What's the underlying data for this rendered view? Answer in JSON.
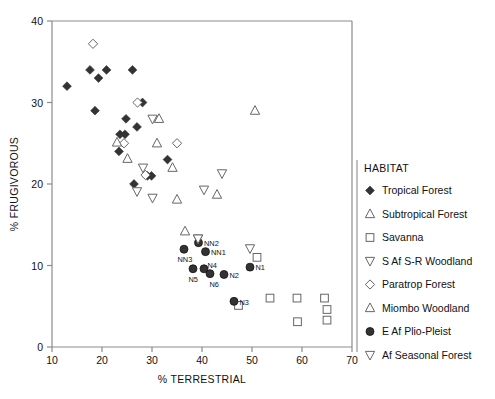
{
  "chart_data": {
    "type": "scatter",
    "title": "",
    "xlabel": "% TERRESTRIAL",
    "ylabel": "% FRUGIVOROUS",
    "xlim": [
      10,
      70
    ],
    "ylim": [
      0,
      40
    ],
    "xticks": [
      10,
      20,
      30,
      40,
      50,
      60,
      70
    ],
    "yticks": [
      0,
      10,
      20,
      30,
      40
    ],
    "grid": false,
    "legend_position": "right",
    "legend_title": "HABITAT",
    "series": [
      {
        "name": "Tropical Forest",
        "marker": "filled-diamond",
        "color": "#333333",
        "points": [
          {
            "x": 13.0,
            "y": 32.0
          },
          {
            "x": 17.6,
            "y": 34.0
          },
          {
            "x": 19.3,
            "y": 33.0
          },
          {
            "x": 20.9,
            "y": 34.0
          },
          {
            "x": 18.6,
            "y": 29.0
          },
          {
            "x": 26.1,
            "y": 34.0
          },
          {
            "x": 28.1,
            "y": 30.0
          },
          {
            "x": 24.8,
            "y": 28.0
          },
          {
            "x": 27.0,
            "y": 27.0
          },
          {
            "x": 23.6,
            "y": 26.1
          },
          {
            "x": 24.6,
            "y": 26.1
          },
          {
            "x": 23.4,
            "y": 24.0
          },
          {
            "x": 33.1,
            "y": 23.0
          },
          {
            "x": 26.4,
            "y": 20.0
          },
          {
            "x": 29.1,
            "y": 21.0
          },
          {
            "x": 29.9,
            "y": 21.0
          }
        ]
      },
      {
        "name": "Subtropical Forest",
        "marker": "open-triangle-up",
        "color": "#6b6b6b",
        "points": [
          {
            "x": 31.4,
            "y": 28.0
          },
          {
            "x": 31.0,
            "y": 25.0
          },
          {
            "x": 34.1,
            "y": 22.0
          },
          {
            "x": 50.6,
            "y": 29.0
          },
          {
            "x": 43.0,
            "y": 18.7
          },
          {
            "x": 35.0,
            "y": 18.1
          }
        ]
      },
      {
        "name": "Savanna",
        "marker": "open-square",
        "color": "#6b6b6b",
        "points": [
          {
            "x": 51.0,
            "y": 11.0
          },
          {
            "x": 47.3,
            "y": 5.1
          },
          {
            "x": 53.6,
            "y": 6.0
          },
          {
            "x": 59.0,
            "y": 6.0
          },
          {
            "x": 59.1,
            "y": 3.1
          },
          {
            "x": 64.5,
            "y": 6.0
          },
          {
            "x": 65.0,
            "y": 4.6
          },
          {
            "x": 65.0,
            "y": 3.3
          }
        ]
      },
      {
        "name": "S Af S-R Woodland",
        "marker": "open-triangle-down",
        "color": "#6b6b6b",
        "points": [
          {
            "x": 30.1,
            "y": 28.0
          },
          {
            "x": 28.2,
            "y": 22.0
          },
          {
            "x": 27.0,
            "y": 19.1
          },
          {
            "x": 30.1,
            "y": 18.3
          },
          {
            "x": 40.4,
            "y": 19.3
          },
          {
            "x": 44.0,
            "y": 21.3
          },
          {
            "x": 39.2,
            "y": 13.3
          },
          {
            "x": 49.6,
            "y": 12.1
          }
        ]
      },
      {
        "name": "Paratrop Forest",
        "marker": "open-diamond",
        "color": "#6b6b6b",
        "points": [
          {
            "x": 18.2,
            "y": 37.2
          },
          {
            "x": 27.1,
            "y": 30.0
          },
          {
            "x": 24.4,
            "y": 25.0
          },
          {
            "x": 35.0,
            "y": 25.0
          },
          {
            "x": 28.7,
            "y": 21.1
          }
        ]
      },
      {
        "name": "Miombo Woodland",
        "marker": "open-triangle-up",
        "color": "#6b6b6b",
        "points": [
          {
            "x": 23.0,
            "y": 25.1
          },
          {
            "x": 25.1,
            "y": 23.1
          },
          {
            "x": 36.6,
            "y": 14.2
          }
        ]
      },
      {
        "name": "E Af Plio-Pleist",
        "marker": "filled-circle",
        "color": "#333333",
        "points": [
          {
            "x": 36.4,
            "y": 12.0,
            "label": "NN3"
          },
          {
            "x": 39.3,
            "y": 12.8,
            "label": "NN2"
          },
          {
            "x": 40.7,
            "y": 11.7,
            "label": "NN1"
          },
          {
            "x": 38.2,
            "y": 9.6,
            "label": "N5"
          },
          {
            "x": 40.4,
            "y": 9.6,
            "label": "N4"
          },
          {
            "x": 41.6,
            "y": 9.0,
            "label": "N6"
          },
          {
            "x": 44.4,
            "y": 8.9,
            "label": "N2"
          },
          {
            "x": 49.6,
            "y": 9.8,
            "label": "N1"
          },
          {
            "x": 46.4,
            "y": 5.6,
            "label": "N3"
          }
        ]
      },
      {
        "name": "Af Seasonal Forest",
        "marker": "open-triangle-down",
        "color": "#6b6b6b",
        "points": [
          {
            "x": 39.2,
            "y": 13.3
          }
        ]
      }
    ]
  },
  "axes": {
    "x_title": "% TERRESTRIAL",
    "y_title": "% FRUGIVOROUS",
    "x_tick_labels": [
      "10",
      "20",
      "30",
      "40",
      "50",
      "60",
      "70"
    ],
    "y_tick_labels": [
      "0",
      "10",
      "20",
      "30",
      "40"
    ]
  },
  "legend": {
    "title": "HABITAT",
    "items": [
      {
        "label": "Tropical Forest",
        "marker": "filled-diamond"
      },
      {
        "label": "Subtropical Forest",
        "marker": "open-triangle-up"
      },
      {
        "label": "Savanna",
        "marker": "open-square"
      },
      {
        "label": "S Af S-R Woodland",
        "marker": "open-triangle-down"
      },
      {
        "label": "Paratrop Forest",
        "marker": "open-diamond"
      },
      {
        "label": "Miombo Woodland",
        "marker": "open-triangle-up"
      },
      {
        "label": "E Af Plio-Pleist",
        "marker": "filled-circle"
      },
      {
        "label": "Af Seasonal Forest",
        "marker": "open-triangle-down"
      }
    ]
  }
}
